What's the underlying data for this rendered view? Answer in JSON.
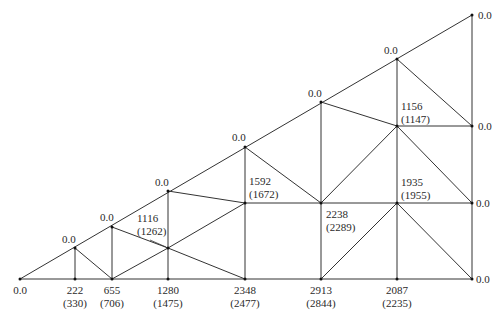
{
  "diagram": {
    "type": "truss",
    "nodes": [
      {
        "id": "A",
        "x": 20,
        "y": 279
      },
      {
        "id": "B",
        "x": 75,
        "y": 279
      },
      {
        "id": "C",
        "x": 112,
        "y": 279
      },
      {
        "id": "D",
        "x": 168,
        "y": 279
      },
      {
        "id": "E",
        "x": 245,
        "y": 279
      },
      {
        "id": "F",
        "x": 321,
        "y": 279
      },
      {
        "id": "G",
        "x": 397,
        "y": 279
      },
      {
        "id": "H",
        "x": 472,
        "y": 279
      },
      {
        "id": "T1",
        "x": 75,
        "y": 248
      },
      {
        "id": "T2",
        "x": 112,
        "y": 227
      },
      {
        "id": "T3",
        "x": 168,
        "y": 191
      },
      {
        "id": "T4",
        "x": 245,
        "y": 147
      },
      {
        "id": "T5",
        "x": 321,
        "y": 102
      },
      {
        "id": "T6",
        "x": 397,
        "y": 59
      },
      {
        "id": "T7",
        "x": 472,
        "y": 15
      },
      {
        "id": "M1",
        "x": 168,
        "y": 248
      },
      {
        "id": "M2",
        "x": 245,
        "y": 203
      },
      {
        "id": "M3",
        "x": 321,
        "y": 203
      },
      {
        "id": "M4",
        "x": 397,
        "y": 203
      },
      {
        "id": "M5",
        "x": 472,
        "y": 203
      },
      {
        "id": "M6",
        "x": 397,
        "y": 126
      },
      {
        "id": "M7",
        "x": 472,
        "y": 126
      }
    ],
    "members": [
      [
        "A",
        "H"
      ],
      [
        "A",
        "T7"
      ],
      [
        "T7",
        "H"
      ],
      [
        "B",
        "T1"
      ],
      [
        "T1",
        "C"
      ],
      [
        "C",
        "T2"
      ],
      [
        "T2",
        "M1"
      ],
      [
        "C",
        "M1"
      ],
      [
        "M1",
        "E"
      ],
      [
        "D",
        "T3"
      ],
      [
        "M1",
        "M2"
      ],
      [
        "T3",
        "M2"
      ],
      [
        "M2",
        "E"
      ],
      [
        "M2",
        "T4"
      ],
      [
        "M2",
        "M5"
      ],
      [
        "T4",
        "M3"
      ],
      [
        "M3",
        "F"
      ],
      [
        "T5",
        "M3"
      ],
      [
        "F",
        "M4"
      ],
      [
        "M4",
        "H"
      ],
      [
        "M4",
        "G"
      ],
      [
        "T5",
        "M6"
      ],
      [
        "M3",
        "M6"
      ],
      [
        "M6",
        "M4"
      ],
      [
        "M6",
        "M5"
      ],
      [
        "M6",
        "M7"
      ],
      [
        "T6",
        "M6"
      ],
      [
        "T6",
        "M7"
      ]
    ],
    "bottom_labels": [
      {
        "x": 20,
        "value": "0.0",
        "paren": ""
      },
      {
        "x": 75,
        "value": "222",
        "paren": "(330)"
      },
      {
        "x": 112,
        "value": "655",
        "paren": "(706)"
      },
      {
        "x": 168,
        "value": "1280",
        "paren": "(1475)"
      },
      {
        "x": 245,
        "value": "2348",
        "paren": "(2477)"
      },
      {
        "x": 321,
        "value": "2913",
        "paren": "(2844)"
      },
      {
        "x": 397,
        "value": "2087",
        "paren": "(2235)"
      }
    ],
    "top_labels": [
      {
        "x": 69,
        "y": 233,
        "value": "0.0"
      },
      {
        "x": 106,
        "y": 212,
        "value": "0.0"
      },
      {
        "x": 162,
        "y": 176,
        "value": "0.0"
      },
      {
        "x": 239,
        "y": 132,
        "value": "0.0"
      },
      {
        "x": 315,
        "y": 87,
        "value": "0.0"
      },
      {
        "x": 391,
        "y": 44,
        "value": "0.0"
      }
    ],
    "right_labels": [
      {
        "y": 9,
        "value": "0.0"
      },
      {
        "y": 120,
        "value": "0.0"
      },
      {
        "y": 197,
        "value": "0.0"
      },
      {
        "y": 273,
        "value": "0.0"
      }
    ],
    "interior_labels": [
      {
        "x": 137,
        "y": 212,
        "value": "1116",
        "paren": "(1262)"
      },
      {
        "x": 249,
        "y": 163,
        "value": "1592",
        "paren": "(1672)"
      },
      {
        "x": 326,
        "y": 210,
        "value": "2238",
        "paren": "(2289)"
      },
      {
        "x": 401,
        "y": 100,
        "value": "1156",
        "paren": "(1147)"
      },
      {
        "x": 401,
        "y": 178,
        "value": "1935",
        "paren": "(1955)"
      }
    ]
  }
}
